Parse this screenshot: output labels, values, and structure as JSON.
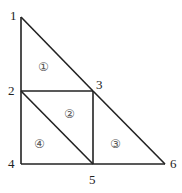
{
  "diagram": {
    "nodes": [
      {
        "id": "1",
        "label": "1",
        "x": 21,
        "y": 17,
        "lx": 10,
        "ly": 20
      },
      {
        "id": "2",
        "label": "2",
        "x": 21,
        "y": 91,
        "lx": 8,
        "ly": 95
      },
      {
        "id": "3",
        "label": "3",
        "x": 93,
        "y": 91,
        "lx": 96,
        "ly": 89
      },
      {
        "id": "4",
        "label": "4",
        "x": 21,
        "y": 164,
        "lx": 8,
        "ly": 168
      },
      {
        "id": "5",
        "label": "5",
        "x": 93,
        "y": 164,
        "lx": 89,
        "ly": 184
      },
      {
        "id": "6",
        "label": "6",
        "x": 165,
        "y": 164,
        "lx": 170,
        "ly": 168
      }
    ],
    "edges": [
      [
        "1",
        "2"
      ],
      [
        "2",
        "4"
      ],
      [
        "1",
        "3"
      ],
      [
        "3",
        "6"
      ],
      [
        "2",
        "3"
      ],
      [
        "4",
        "5"
      ],
      [
        "5",
        "6"
      ],
      [
        "3",
        "5"
      ],
      [
        "2",
        "5"
      ]
    ],
    "regions": [
      {
        "label": "①",
        "x": 44,
        "y": 70
      },
      {
        "label": "②",
        "x": 70,
        "y": 117
      },
      {
        "label": "③",
        "x": 116,
        "y": 147
      },
      {
        "label": "④",
        "x": 40,
        "y": 147
      }
    ]
  }
}
